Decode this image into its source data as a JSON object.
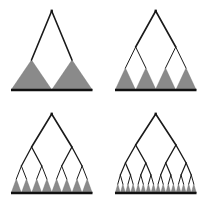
{
  "figure": {
    "name": "recursive-binary-subdivision",
    "background_color": "#ffffff",
    "panel_count": 4,
    "grid": {
      "columns": 2,
      "rows": 2
    }
  },
  "style": {
    "triangle_fill": "#8a8a8a",
    "triangle_stroke": "#6f6f6f",
    "branch_color": "#1a1a1a",
    "baseline_color": "#111111",
    "apex_node_color": "#111111",
    "branch_width_root": 1.6,
    "branch_width_leaf": 1.0,
    "baseline_thickness": 2.4
  },
  "geometry": {
    "apex_x": 51.7,
    "apex_y": 11.0,
    "baseline_y": 90.0,
    "baseline_x_start": 11.0,
    "baseline_x_end": 92.5,
    "triangle_half_width_note": "half-width equals half the leaf spacing so bases tile the baseline"
  },
  "panels": [
    {
      "id": "panel-1",
      "label": "depth 1",
      "leaf_count": 2,
      "split_levels": 1,
      "triangle_height": 30,
      "branch_nodes_y": [
        11.0,
        60.0
      ],
      "leaf_x": [
        31.5,
        72.0
      ],
      "node_y_leaf": 60.0,
      "triangle_half_width": 20.4
    },
    {
      "id": "panel-2",
      "label": "depth 2",
      "leaf_count": 4,
      "split_levels": 2,
      "triangle_height": 22,
      "branch_nodes_y": [
        11.0,
        47.0,
        68.0
      ],
      "leaf_x": [
        21.4,
        41.9,
        61.5,
        82.0
      ],
      "node_y_leaf": 68.0,
      "triangle_half_width": 10.2
    },
    {
      "id": "panel-3",
      "label": "depth 3",
      "leaf_count": 8,
      "split_levels": 3,
      "triangle_height": 14,
      "branch_nodes_y": [
        11.0,
        44.0,
        63.0,
        76.0
      ],
      "leaf_x": [
        16.3,
        26.5,
        36.7,
        46.9,
        56.6,
        66.8,
        77.0,
        87.2
      ],
      "node_y_leaf": 76.0,
      "triangle_half_width": 5.1
    },
    {
      "id": "panel-4",
      "label": "depth 4",
      "leaf_count": 16,
      "split_levels": 4,
      "triangle_height": 9,
      "branch_nodes_y": [
        11.0,
        42.0,
        60.0,
        72.0,
        81.0
      ],
      "leaf_x": [
        13.8,
        18.9,
        24.0,
        29.1,
        34.2,
        39.3,
        44.4,
        49.5,
        54.1,
        59.2,
        64.3,
        69.4,
        74.5,
        79.6,
        84.7,
        89.8
      ],
      "node_y_leaf": 81.0,
      "triangle_half_width": 2.55
    }
  ]
}
